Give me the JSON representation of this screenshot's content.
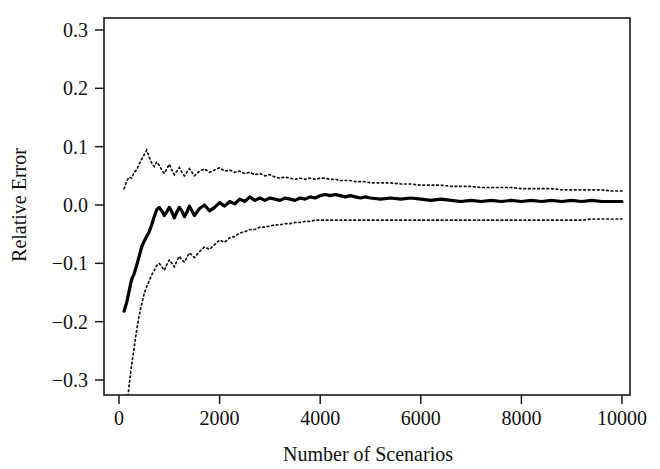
{
  "figure": {
    "background_color": "#ffffff",
    "foreground_color": "#111111",
    "width": 660,
    "height": 469
  },
  "chart_data": {
    "type": "line",
    "title": "",
    "subtitle": "",
    "xlabel": "Number of Scenarios",
    "ylabel": "Relative Error",
    "xlim": [
      0,
      10000
    ],
    "ylim": [
      -0.3,
      0.3
    ],
    "xticks": [
      0,
      2000,
      4000,
      6000,
      8000,
      10000
    ],
    "xticklabels": [
      "0",
      "2000",
      "4000",
      "6000",
      "8000",
      "10000"
    ],
    "yticks": [
      -0.3,
      -0.2,
      -0.1,
      0.0,
      0.1,
      0.2,
      0.3
    ],
    "yticklabels": [
      "−0.3",
      "−0.2",
      "−0.1",
      "0.0",
      "0.1",
      "0.2",
      "0.3"
    ],
    "grid": false,
    "legend": null,
    "legend_position": "none",
    "frame": "box",
    "annotations": [],
    "x": [
      100,
      150,
      200,
      250,
      300,
      350,
      400,
      450,
      500,
      550,
      600,
      650,
      700,
      750,
      800,
      850,
      900,
      950,
      1000,
      1050,
      1100,
      1150,
      1200,
      1250,
      1300,
      1350,
      1400,
      1450,
      1500,
      1600,
      1700,
      1800,
      1900,
      2000,
      2100,
      2200,
      2300,
      2400,
      2500,
      2600,
      2700,
      2800,
      2900,
      3000,
      3100,
      3200,
      3300,
      3400,
      3500,
      3600,
      3700,
      3800,
      3900,
      4000,
      4100,
      4200,
      4300,
      4400,
      4500,
      4600,
      4700,
      4800,
      4900,
      5000,
      5200,
      5400,
      5600,
      5800,
      6000,
      6200,
      6400,
      6600,
      6800,
      7000,
      7200,
      7400,
      7600,
      7800,
      8000,
      8200,
      8400,
      8600,
      8800,
      9000,
      9200,
      9400,
      9600,
      9800,
      10000
    ],
    "series": [
      {
        "name": "mean relative error",
        "style": "solid",
        "color": "#000000",
        "values": [
          -0.182,
          -0.168,
          -0.148,
          -0.128,
          -0.118,
          -0.104,
          -0.088,
          -0.072,
          -0.062,
          -0.054,
          -0.046,
          -0.034,
          -0.02,
          -0.008,
          -0.004,
          -0.01,
          -0.018,
          -0.012,
          -0.004,
          -0.012,
          -0.022,
          -0.012,
          -0.004,
          -0.01,
          -0.02,
          -0.012,
          -0.002,
          -0.01,
          -0.018,
          -0.006,
          0.0,
          -0.01,
          -0.004,
          0.004,
          -0.002,
          0.006,
          0.002,
          0.01,
          0.006,
          0.014,
          0.008,
          0.012,
          0.008,
          0.012,
          0.01,
          0.008,
          0.012,
          0.01,
          0.008,
          0.012,
          0.01,
          0.014,
          0.012,
          0.016,
          0.018,
          0.016,
          0.018,
          0.016,
          0.014,
          0.016,
          0.014,
          0.012,
          0.014,
          0.012,
          0.01,
          0.012,
          0.01,
          0.012,
          0.01,
          0.008,
          0.01,
          0.008,
          0.006,
          0.008,
          0.006,
          0.008,
          0.006,
          0.008,
          0.006,
          0.008,
          0.006,
          0.008,
          0.006,
          0.008,
          0.006,
          0.008,
          0.006,
          0.006,
          0.006
        ]
      },
      {
        "name": "upper confidence bound",
        "style": "dotted",
        "color": "#111111",
        "values": [
          0.028,
          0.04,
          0.048,
          0.046,
          0.056,
          0.06,
          0.07,
          0.078,
          0.086,
          0.094,
          0.082,
          0.072,
          0.066,
          0.074,
          0.068,
          0.06,
          0.054,
          0.062,
          0.07,
          0.06,
          0.052,
          0.058,
          0.064,
          0.056,
          0.05,
          0.056,
          0.062,
          0.056,
          0.05,
          0.058,
          0.062,
          0.056,
          0.06,
          0.064,
          0.058,
          0.06,
          0.056,
          0.058,
          0.054,
          0.056,
          0.052,
          0.054,
          0.05,
          0.052,
          0.048,
          0.046,
          0.048,
          0.046,
          0.044,
          0.046,
          0.044,
          0.046,
          0.044,
          0.046,
          0.046,
          0.044,
          0.044,
          0.042,
          0.042,
          0.042,
          0.04,
          0.04,
          0.04,
          0.038,
          0.038,
          0.038,
          0.036,
          0.036,
          0.034,
          0.034,
          0.034,
          0.032,
          0.032,
          0.032,
          0.03,
          0.03,
          0.03,
          0.03,
          0.028,
          0.028,
          0.028,
          0.028,
          0.026,
          0.026,
          0.026,
          0.026,
          0.026,
          0.024,
          0.024
        ]
      },
      {
        "name": "lower confidence bound",
        "style": "dotted",
        "color": "#111111",
        "values": [
          -0.39,
          -0.35,
          -0.31,
          -0.275,
          -0.245,
          -0.215,
          -0.19,
          -0.17,
          -0.152,
          -0.14,
          -0.13,
          -0.12,
          -0.112,
          -0.104,
          -0.1,
          -0.106,
          -0.112,
          -0.102,
          -0.094,
          -0.1,
          -0.106,
          -0.096,
          -0.088,
          -0.094,
          -0.098,
          -0.09,
          -0.082,
          -0.086,
          -0.09,
          -0.08,
          -0.072,
          -0.076,
          -0.068,
          -0.06,
          -0.064,
          -0.056,
          -0.054,
          -0.048,
          -0.046,
          -0.042,
          -0.042,
          -0.038,
          -0.038,
          -0.036,
          -0.034,
          -0.034,
          -0.032,
          -0.032,
          -0.03,
          -0.03,
          -0.028,
          -0.028,
          -0.026,
          -0.026,
          -0.026,
          -0.026,
          -0.026,
          -0.026,
          -0.026,
          -0.026,
          -0.026,
          -0.026,
          -0.026,
          -0.026,
          -0.026,
          -0.026,
          -0.026,
          -0.026,
          -0.026,
          -0.026,
          -0.026,
          -0.026,
          -0.026,
          -0.026,
          -0.026,
          -0.026,
          -0.026,
          -0.026,
          -0.026,
          -0.026,
          -0.026,
          -0.026,
          -0.026,
          -0.026,
          -0.026,
          -0.024,
          -0.024,
          -0.024,
          -0.024
        ]
      }
    ]
  }
}
